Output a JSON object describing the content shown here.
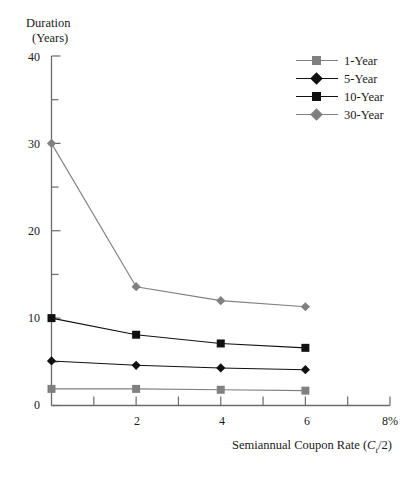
{
  "chart_data": {
    "type": "line",
    "title": "",
    "xlabel": "Semiannual Coupon Rate (Ct/2)",
    "ylabel": "Duration (Years)",
    "x": [
      0,
      2,
      4,
      6
    ],
    "xlim": [
      0,
      8
    ],
    "ylim": [
      0,
      40
    ],
    "xticks": [
      0,
      1,
      2,
      3,
      4,
      5,
      6,
      7,
      8
    ],
    "xtick_labels": [
      "",
      "",
      "2",
      "",
      "4",
      "",
      "6",
      "",
      "8%"
    ],
    "yticks": [
      0,
      5,
      10,
      15,
      20,
      25,
      30,
      35,
      40
    ],
    "ytick_labels": [
      "0",
      "",
      "10",
      "",
      "20",
      "",
      "30",
      "",
      "40"
    ],
    "grid": false,
    "legend_position": "top-right",
    "series": [
      {
        "name": "1-Year",
        "marker": "square",
        "color": "#808080",
        "values": [
          1.9,
          1.9,
          1.8,
          1.7
        ]
      },
      {
        "name": "5-Year",
        "marker": "diamond",
        "color": "#111111",
        "values": [
          5.1,
          4.6,
          4.3,
          4.1
        ]
      },
      {
        "name": "10-Year",
        "marker": "square",
        "color": "#111111",
        "values": [
          10.0,
          8.1,
          7.1,
          6.6
        ]
      },
      {
        "name": "30-Year",
        "marker": "diamond",
        "color": "#808080",
        "values": [
          30.0,
          13.6,
          12.0,
          11.3
        ]
      }
    ]
  },
  "axes": {
    "ylabel_line1": "Duration",
    "ylabel_line2": "(Years)",
    "xlabel_prefix": "Semiannual Coupon Rate (",
    "xlabel_var": "C",
    "xlabel_sub": "t",
    "xlabel_suffix": "/2)",
    "ytick_40": "40",
    "ytick_30": "30",
    "ytick_20": "20",
    "ytick_10": "10",
    "ytick_0": "0",
    "xtick_2": "2",
    "xtick_4": "4",
    "xtick_6": "6",
    "xtick_8": "8%"
  },
  "legend": {
    "items": [
      {
        "label": "1-Year"
      },
      {
        "label": "5-Year"
      },
      {
        "label": "10-Year"
      },
      {
        "label": "30-Year"
      }
    ]
  },
  "colors": {
    "gray": "#808080",
    "black": "#111111",
    "axis": "#6b6b6b"
  },
  "cropped_top_text": "· · ·  ·  ·"
}
